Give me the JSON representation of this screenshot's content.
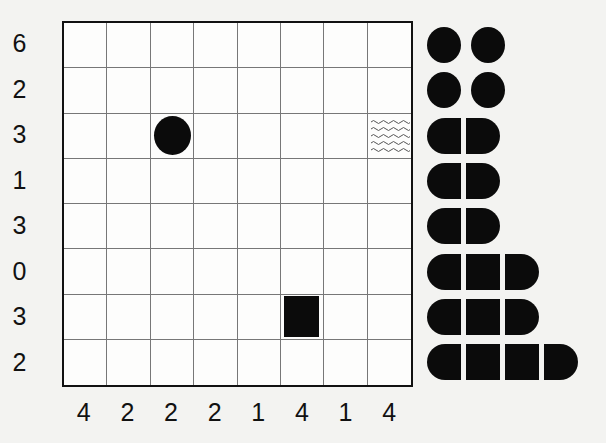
{
  "puzzle": {
    "type": "battleships",
    "rows": 8,
    "cols": 8,
    "row_clues": [
      "6",
      "2",
      "3",
      "1",
      "3",
      "0",
      "3",
      "2"
    ],
    "col_clues": [
      "4",
      "2",
      "2",
      "2",
      "1",
      "4",
      "1",
      "4"
    ],
    "given_cells": [
      {
        "row": 3,
        "col": 3,
        "content": "submarine"
      },
      {
        "row": 3,
        "col": 8,
        "content": "water"
      },
      {
        "row": 7,
        "col": 6,
        "content": "ship-middle"
      }
    ],
    "fleet": [
      {
        "name": "submarine",
        "length": 1,
        "count": 4
      },
      {
        "name": "destroyer",
        "length": 2,
        "count": 3
      },
      {
        "name": "cruiser",
        "length": 3,
        "count": 2
      },
      {
        "name": "battleship",
        "length": 4,
        "count": 1
      }
    ]
  },
  "colors": {
    "ink": "#0b0b0b",
    "background": "#f3f3f1",
    "grid_line": "#777777",
    "water": "#555555"
  }
}
